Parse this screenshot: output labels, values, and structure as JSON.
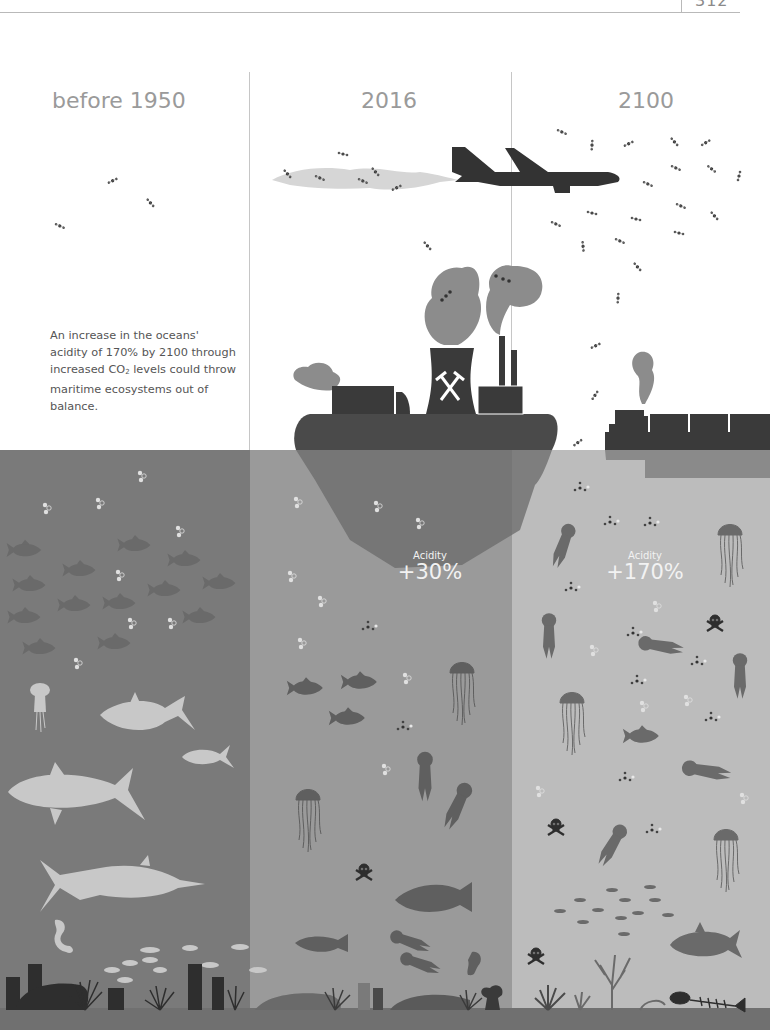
{
  "page": {
    "number": "312"
  },
  "eras": [
    {
      "title": "before 1950",
      "sea_color": "#7a7a7a"
    },
    {
      "title": "2016",
      "sea_color": "#9a9a9a",
      "acidity_label": "Acidity",
      "acidity_value": "+30%"
    },
    {
      "title": "2100",
      "sea_color": "#bcbcbc",
      "acidity_label": "Acidity",
      "acidity_value": "+170%"
    }
  ],
  "caption": {
    "line_a": "An increase in the oceans' acidity of 170% by 2100 through increased CO",
    "sub": "2",
    "line_b": " levels could throw maritime ecosystems out of balance."
  },
  "icons": {
    "above_water": [
      "co2-molecule-icon",
      "airplane-icon",
      "contrail-cloud-icon",
      "factory-island-icon",
      "cooling-tower-icon",
      "hammer-pick-icon",
      "smokestack-icon",
      "truck-icon",
      "smoke-icon",
      "container-ship-icon"
    ],
    "under_water": [
      "fish-school-icon",
      "tuna-icon",
      "marlin-icon",
      "jellyfish-icon",
      "seahorse-icon",
      "skull-crossbones-icon",
      "coral-icon",
      "fish-skeleton-icon",
      "carbonic-acid-molecule-icon"
    ]
  },
  "colors": {
    "dark_silhouette": "#3a3a3a",
    "smoke": "#8c8c8c",
    "contrail": "#d6d6d6",
    "title_text": "#9a9a9a"
  }
}
